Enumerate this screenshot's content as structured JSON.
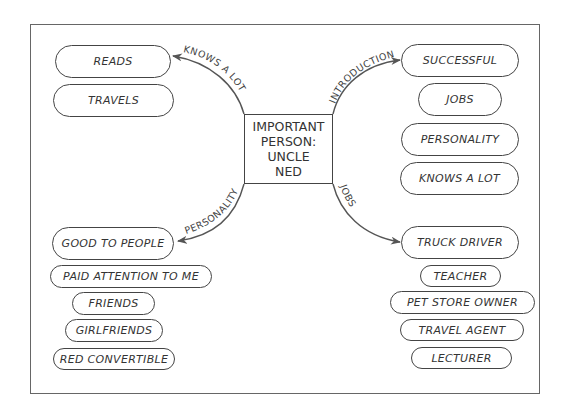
{
  "center": {
    "lines": [
      "IMPORTANT",
      "PERSON:",
      "UNCLE",
      "NED"
    ]
  },
  "branches": {
    "top_left": {
      "label": "KNOWS A LOT",
      "items": [
        "READS",
        "TRAVELS"
      ]
    },
    "top_right": {
      "label": "INTRODUCTION",
      "items": [
        "SUCCESSFUL",
        "JOBS",
        "PERSONALITY",
        "KNOWS A LOT"
      ]
    },
    "bottom_left": {
      "label": "PERSONALITY",
      "items": [
        "GOOD TO PEOPLE",
        "PAID ATTENTION TO ME",
        "FRIENDS",
        "GIRLFRIENDS",
        "RED CONVERTIBLE"
      ]
    },
    "bottom_right": {
      "label": "JOBS",
      "items": [
        "TRUCK DRIVER",
        "TEACHER",
        "PET STORE OWNER",
        "TRAVEL AGENT",
        "LECTURER"
      ]
    }
  },
  "colors": {
    "stroke": "#444444",
    "text": "#333333",
    "background": "#ffffff"
  }
}
